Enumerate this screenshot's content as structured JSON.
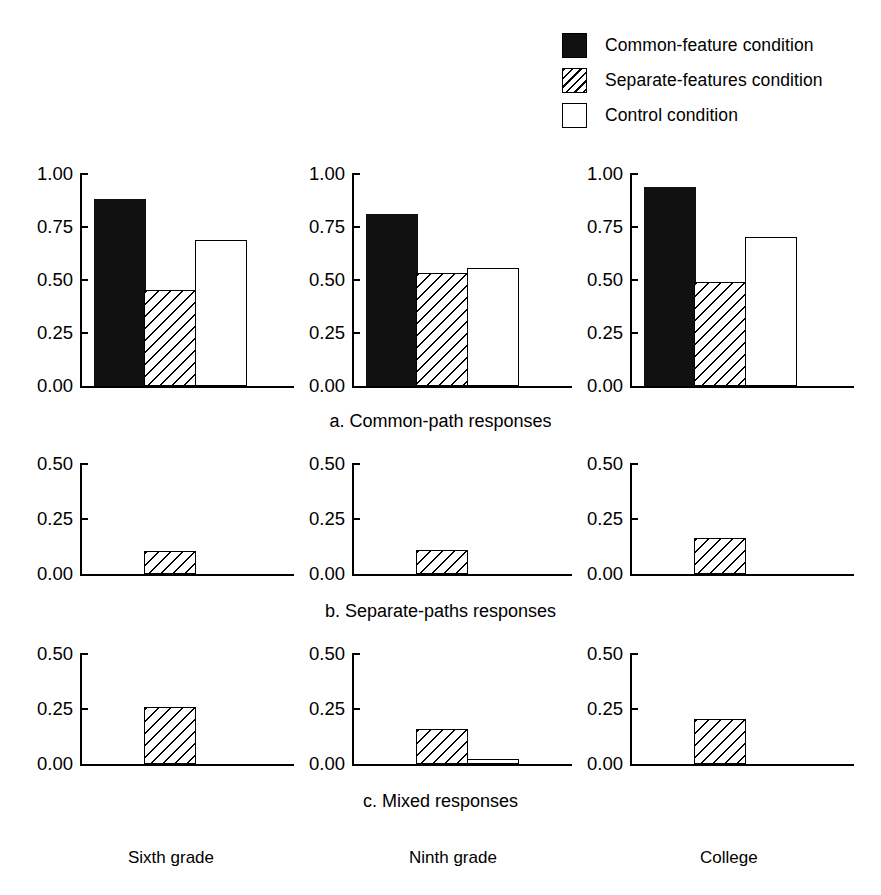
{
  "legend": {
    "items": [
      {
        "label": "Common-feature condition",
        "swatch": "solid-square-icon"
      },
      {
        "label": "Separate-features condition",
        "swatch": "hatched-square-icon"
      },
      {
        "label": "Control condition",
        "swatch": "open-square-icon"
      }
    ]
  },
  "captions": {
    "a": "a. Common-path responses",
    "b": "b. Separate-paths responses",
    "c": "c. Mixed responses"
  },
  "columns": [
    {
      "label": "Sixth grade"
    },
    {
      "label": "Ninth grade"
    },
    {
      "label": "College"
    }
  ],
  "axis": {
    "row_a_ticks": [
      "1.00",
      "0.75",
      "0.50",
      "0.25",
      "0.00"
    ],
    "row_bc_ticks": [
      "0.50",
      "0.25",
      "0.00"
    ]
  },
  "chart_data": {
    "type": "bar",
    "title": "",
    "xlabel": "",
    "ylabel": "",
    "grid": false,
    "legend_position": "top-right",
    "series_names": [
      "Common-feature condition",
      "Separate-features condition",
      "Control condition"
    ],
    "categories": [
      "Sixth grade",
      "Ninth grade",
      "College"
    ],
    "panels": [
      {
        "id": "a",
        "caption": "a. Common-path responses",
        "ylim": [
          0.0,
          1.0
        ],
        "yticks": [
          0.0,
          0.25,
          0.5,
          0.75,
          1.0
        ],
        "groups": [
          {
            "category": "Sixth grade",
            "values": [
              0.88,
              0.455,
              0.69
            ]
          },
          {
            "category": "Ninth grade",
            "values": [
              0.81,
              0.535,
              0.555
            ]
          },
          {
            "category": "College",
            "values": [
              0.94,
              0.49,
              0.705
            ]
          }
        ]
      },
      {
        "id": "b",
        "caption": "b. Separate-paths responses",
        "ylim": [
          0.0,
          0.5
        ],
        "yticks": [
          0.0,
          0.25,
          0.5
        ],
        "groups": [
          {
            "category": "Sixth grade",
            "values": [
              0.0,
              0.105,
              0.0
            ]
          },
          {
            "category": "Ninth grade",
            "values": [
              0.0,
              0.11,
              0.0
            ]
          },
          {
            "category": "College",
            "values": [
              0.0,
              0.165,
              0.0
            ]
          }
        ]
      },
      {
        "id": "c",
        "caption": "c. Mixed responses",
        "ylim": [
          0.0,
          0.5
        ],
        "yticks": [
          0.0,
          0.25,
          0.5
        ],
        "groups": [
          {
            "category": "Sixth grade",
            "values": [
              0.0,
              0.26,
              0.0
            ]
          },
          {
            "category": "Ninth grade",
            "values": [
              0.0,
              0.16,
              0.025
            ]
          },
          {
            "category": "College",
            "values": [
              0.0,
              0.205,
              0.0
            ]
          }
        ]
      }
    ]
  }
}
